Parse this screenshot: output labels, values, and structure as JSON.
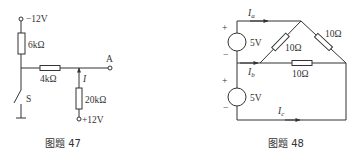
{
  "figures": [
    {
      "id": "fig47",
      "caption": "图题 47",
      "terminals": {
        "top": "−12V",
        "bottom": "+12V",
        "output": "A"
      },
      "resistors": [
        {
          "name": "R1",
          "value": "6kΩ"
        },
        {
          "name": "R2",
          "value": "4kΩ"
        },
        {
          "name": "R3",
          "value": "20kΩ"
        }
      ],
      "switch_label": "S",
      "current_label": "I"
    },
    {
      "id": "fig48",
      "caption": "图题 48",
      "sources": [
        {
          "name": "upper-source",
          "value": "5V",
          "plus": "+",
          "minus": "−"
        },
        {
          "name": "lower-source",
          "value": "5V",
          "plus": "+",
          "minus": "−"
        }
      ],
      "resistors": [
        {
          "name": "diag-left",
          "value": "10Ω"
        },
        {
          "name": "diag-right",
          "value": "10Ω"
        },
        {
          "name": "horizontal",
          "value": "10Ω"
        }
      ],
      "currents": [
        {
          "main": "I",
          "sub": "a"
        },
        {
          "main": "I",
          "sub": "b"
        },
        {
          "main": "I",
          "sub": "c"
        }
      ]
    }
  ]
}
